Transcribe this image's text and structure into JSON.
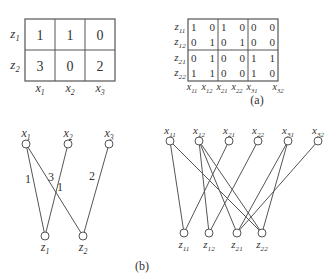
{
  "panel_a": {
    "caption": "(a)",
    "left_matrix": {
      "rows": [
        "z1",
        "z2"
      ],
      "cols": [
        "x1",
        "x2",
        "x3"
      ],
      "cells": [
        [
          "1",
          "1",
          "0"
        ],
        [
          "3",
          "0",
          "2"
        ]
      ]
    },
    "right_matrix": {
      "rows": [
        "z11",
        "z12",
        "z21",
        "z22"
      ],
      "cols": [
        "x11",
        "x12",
        "x21",
        "x22",
        "x31",
        "x32"
      ],
      "cells": [
        [
          "1",
          "0",
          "1",
          "0",
          "0",
          "0"
        ],
        [
          "0",
          "1",
          "0",
          "1",
          "0",
          "0"
        ],
        [
          "0",
          "1",
          "0",
          "0",
          "1",
          "1"
        ],
        [
          "1",
          "1",
          "0",
          "0",
          "1",
          "0"
        ]
      ]
    }
  },
  "panel_b": {
    "caption": "(b)",
    "left_graph": {
      "top_nodes": [
        {
          "id": "x1",
          "x": 26,
          "y": 144
        },
        {
          "id": "x2",
          "x": 68,
          "y": 144
        },
        {
          "id": "x3",
          "x": 109,
          "y": 144
        }
      ],
      "bottom_nodes": [
        {
          "id": "z1",
          "x": 45,
          "y": 236
        },
        {
          "id": "z2",
          "x": 83,
          "y": 236
        }
      ],
      "edges": [
        {
          "from": "x1",
          "to": "z1",
          "label": "1",
          "lx": 28,
          "ly": 183
        },
        {
          "from": "x1",
          "to": "z2",
          "label": "3",
          "lx": 51,
          "ly": 181
        },
        {
          "from": "x2",
          "to": "z1",
          "label": "1",
          "lx": 60,
          "ly": 191
        },
        {
          "from": "x3",
          "to": "z2",
          "label": "2",
          "lx": 92,
          "ly": 180
        }
      ]
    },
    "right_graph": {
      "top_nodes": [
        {
          "id": "x11",
          "x": 170,
          "y": 141
        },
        {
          "id": "x12",
          "x": 199,
          "y": 141
        },
        {
          "id": "x21",
          "x": 229,
          "y": 141
        },
        {
          "id": "x22",
          "x": 258,
          "y": 141
        },
        {
          "id": "x31",
          "x": 288,
          "y": 141
        },
        {
          "id": "x32",
          "x": 318,
          "y": 141
        }
      ],
      "bottom_nodes": [
        {
          "id": "z11",
          "x": 184,
          "y": 233
        },
        {
          "id": "z12",
          "x": 209,
          "y": 233
        },
        {
          "id": "z21",
          "x": 237,
          "y": 233
        },
        {
          "id": "z22",
          "x": 262,
          "y": 233
        }
      ],
      "edges": [
        [
          "x11",
          "z11"
        ],
        [
          "x11",
          "z22"
        ],
        [
          "x12",
          "z12"
        ],
        [
          "x12",
          "z21"
        ],
        [
          "x12",
          "z22"
        ],
        [
          "x21",
          "z11"
        ],
        [
          "x22",
          "z12"
        ],
        [
          "x31",
          "z21"
        ],
        [
          "x31",
          "z22"
        ],
        [
          "x32",
          "z21"
        ]
      ]
    }
  }
}
